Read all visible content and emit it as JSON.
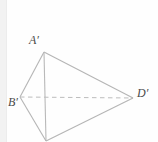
{
  "figure": {
    "name": "primed-tetrahedron-projection",
    "background_color": "#fefefe",
    "margin_strip_color": "#f2f2f2",
    "solid_edge_color": "#b5b5b5",
    "dashed_edge_color": "#bdbdbd",
    "label_color": "#4a4a4a",
    "labels": {
      "a_prime": "A′",
      "b_prime": "B′",
      "d_prime": "D′"
    },
    "vertices": {
      "a_prime": {
        "x": 44,
        "y": 52
      },
      "b_prime": {
        "x": 20,
        "y": 97
      },
      "c_prime": {
        "x": 46,
        "y": 141
      },
      "d_prime": {
        "x": 133,
        "y": 98
      }
    },
    "edges": [
      {
        "id": "edge-a-b",
        "from": "a_prime",
        "to": "b_prime",
        "style": "solid"
      },
      {
        "id": "edge-a-d",
        "from": "a_prime",
        "to": "d_prime",
        "style": "solid"
      },
      {
        "id": "edge-a-c",
        "from": "a_prime",
        "to": "c_prime",
        "style": "solid"
      },
      {
        "id": "edge-b-c",
        "from": "b_prime",
        "to": "c_prime",
        "style": "solid"
      },
      {
        "id": "edge-c-d",
        "from": "c_prime",
        "to": "d_prime",
        "style": "solid"
      },
      {
        "id": "edge-b-d",
        "from": "b_prime",
        "to": "d_prime",
        "style": "dashed"
      }
    ]
  }
}
